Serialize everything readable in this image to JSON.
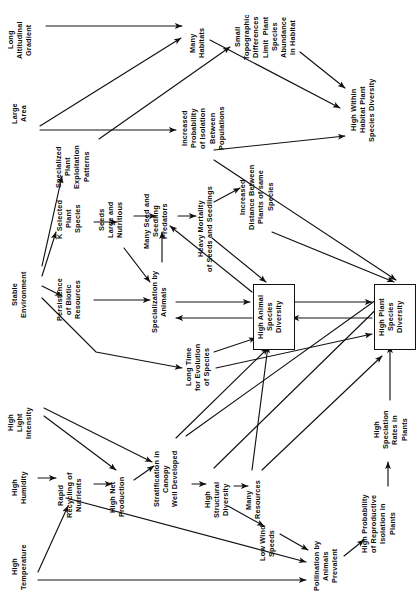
{
  "diagram": {
    "type": "flow-diagram",
    "orientation": "text-rotated-90-ccw",
    "canvas": {
      "width": 419,
      "height": 598
    },
    "colors": {
      "background": "#ffffff",
      "ink": "#0b0b0b",
      "edge": "#111111"
    },
    "nodes": [
      {
        "id": "long-altitudinal-gradient",
        "label": "Long\nAltitudinal\nGradient",
        "x": 6,
        "y": 6,
        "w": 34,
        "h": 68,
        "boxed": false
      },
      {
        "id": "large-area",
        "label": "Large\nArea",
        "x": 10,
        "y": 92,
        "w": 24,
        "h": 44,
        "boxed": false
      },
      {
        "id": "stable-environment",
        "label": "Stable\nEnvironment",
        "x": 10,
        "y": 258,
        "w": 24,
        "h": 74,
        "boxed": false
      },
      {
        "id": "high-light-intensity",
        "label": "High\nLight\nIntensity",
        "x": 6,
        "y": 398,
        "w": 34,
        "h": 50,
        "boxed": false
      },
      {
        "id": "high-humidity",
        "label": "High\nHumidity",
        "x": 10,
        "y": 462,
        "w": 24,
        "h": 52,
        "boxed": false
      },
      {
        "id": "high-temperature",
        "label": "High\nTemperature",
        "x": 10,
        "y": 536,
        "w": 24,
        "h": 62,
        "boxed": false
      },
      {
        "id": "many-habitats",
        "label": "Many\nHabitats",
        "x": 188,
        "y": 20,
        "w": 24,
        "h": 46,
        "boxed": false
      },
      {
        "id": "small-topographic-differences",
        "label": "Small\nTopographic\nDifferences\nLimit  Plant\nSpecies\nAbundance\nin Habitat",
        "x": 233,
        "y": 6,
        "w": 70,
        "h": 62,
        "boxed": false
      },
      {
        "id": "high-within-habitat-plant-species-diversity",
        "label": "High Within\nHabitat Plant\nSpecies Diversity",
        "x": 349,
        "y": 72,
        "w": 38,
        "h": 76,
        "boxed": false
      },
      {
        "id": "increased-probability-isolation",
        "label": "Increased\nProbability\nof Isolation\nBetween\nPopulations",
        "x": 180,
        "y": 100,
        "w": 50,
        "h": 56,
        "boxed": false
      },
      {
        "id": "specialized-plant-exploitation-patterns",
        "label": "Specialized\nPlant\nExploitation\nPatterns",
        "x": 54,
        "y": 138,
        "w": 42,
        "h": 58,
        "boxed": false
      },
      {
        "id": "k-selected-plant-species",
        "label": "K Selected\nPlant\nSpecies",
        "x": 55,
        "y": 192,
        "w": 34,
        "h": 54,
        "boxed": false
      },
      {
        "id": "seeds-large-and-nutritious",
        "label": "Seeds\nLarge and\nNutritious",
        "x": 97,
        "y": 194,
        "w": 34,
        "h": 52,
        "boxed": false
      },
      {
        "id": "many-seed-and-seedling-predators",
        "label": "Many Seed and\nSeedling\nPredators",
        "x": 142,
        "y": 186,
        "w": 34,
        "h": 70,
        "boxed": false
      },
      {
        "id": "heavy-mortality-seeds-seedlings",
        "label": "Heavy Mortality\nof Seeds and Seedlings",
        "x": 196,
        "y": 186,
        "w": 24,
        "h": 86,
        "boxed": false
      },
      {
        "id": "increased-distance-between-plants",
        "label": "Increased\nDistance Between\nPlants of same\nSpecies",
        "x": 238,
        "y": 162,
        "w": 46,
        "h": 70,
        "boxed": false
      },
      {
        "id": "persistence-of-biotic-resources",
        "label": "Persistence\nof Biotic\nResources",
        "x": 55,
        "y": 272,
        "w": 34,
        "h": 56,
        "boxed": false
      },
      {
        "id": "specialization-by-animals",
        "label": "Specialization by\nAnimals",
        "x": 150,
        "y": 262,
        "w": 24,
        "h": 80,
        "boxed": false
      },
      {
        "id": "long-time-for-evolution-of-species",
        "label": "Long Time\nfor Evolution\nof Species",
        "x": 184,
        "y": 340,
        "w": 36,
        "h": 54,
        "boxed": false
      },
      {
        "id": "high-animal-species-diversity",
        "label": "High Animal\nSpecies\nDiversity",
        "x": 253,
        "y": 284,
        "w": 36,
        "h": 58,
        "boxed": true
      },
      {
        "id": "high-plant-species-diversity",
        "label": "High Plant\nSpecies\nDiversity",
        "x": 374,
        "y": 284,
        "w": 36,
        "h": 58,
        "boxed": true
      },
      {
        "id": "rapid-recycling-of-nutrients",
        "label": "Rapid\nRecycling of\nNutrients",
        "x": 56,
        "y": 466,
        "w": 36,
        "h": 58,
        "boxed": false
      },
      {
        "id": "high-net-production",
        "label": "High Net\nProduction",
        "x": 108,
        "y": 470,
        "w": 26,
        "h": 54,
        "boxed": false
      },
      {
        "id": "stratification-in-canopy",
        "label": "Stratification in\nCanopy\nWell Developed",
        "x": 152,
        "y": 440,
        "w": 38,
        "h": 78,
        "boxed": false
      },
      {
        "id": "high-structural-diversity",
        "label": "High\nStructural\nDiversity",
        "x": 203,
        "y": 472,
        "w": 34,
        "h": 56,
        "boxed": false
      },
      {
        "id": "many-resources",
        "label": "Many\nResources",
        "x": 244,
        "y": 474,
        "w": 24,
        "h": 52,
        "boxed": false
      },
      {
        "id": "low-wind-speeds",
        "label": "Low Wind\nSpeeds",
        "x": 258,
        "y": 518,
        "w": 24,
        "h": 50,
        "boxed": false
      },
      {
        "id": "pollination-by-animals-prevalent",
        "label": "Pollination by\nAnimals\nPrevalent",
        "x": 312,
        "y": 534,
        "w": 36,
        "h": 64,
        "boxed": false
      },
      {
        "id": "high-probability-reproductive-isolation",
        "label": "High Probability\nof Reproductive\nIsolation in\nPlants",
        "x": 360,
        "y": 484,
        "w": 46,
        "h": 80,
        "boxed": false
      },
      {
        "id": "high-speciation-rates-in-plants",
        "label": "High\nSpeciation\nRates in\nPlants",
        "x": 372,
        "y": 402,
        "w": 42,
        "h": 56,
        "boxed": false
      }
    ],
    "edges": [
      {
        "from": "long-altitudinal-gradient",
        "to": "many-habitats",
        "d": "M 46 26 L 182 26"
      },
      {
        "from": "large-area",
        "to": "many-habitats",
        "d": "M 40 126 L 181 38"
      },
      {
        "from": "large-area",
        "to": "increased-probability-isolation",
        "d": "M 40 130 L 176 130"
      },
      {
        "from": "specialized-plant-exploitation-patterns",
        "to": "small-topographic-differences",
        "d": "M 99 139 L 230 47"
      },
      {
        "from": "many-habitats",
        "to": "high-within-habitat-plant-species-diversity",
        "d": "M 210 40 L 340 108"
      },
      {
        "from": "small-topographic-differences",
        "to": "high-within-habitat-plant-species-diversity",
        "d": "M 300 52 L 345 88"
      },
      {
        "from": "increased-probability-isolation",
        "to": "high-within-habitat-plant-species-diversity",
        "d": "M 214 150 L 345 136"
      },
      {
        "from": "stable-environment",
        "to": "specialized-plant-exploitation-patterns",
        "d": "M 42 266 L 62 176"
      },
      {
        "from": "stable-environment",
        "to": "k-selected-plant-species",
        "d": "M 42 276 L 56 232"
      },
      {
        "from": "stable-environment",
        "to": "persistence-of-biotic-resources",
        "d": "M 42 286 L 62 296"
      },
      {
        "from": "stable-environment",
        "to": "long-time-for-evolution-of-species",
        "d": "M 42 298 L 96 352 L 182 368"
      },
      {
        "from": "k-selected-plant-species",
        "to": "seeds-large-and-nutritious",
        "d": "M 94 222 L 117 222"
      },
      {
        "from": "seeds-large-and-nutritious",
        "to": "many-seed-and-seedling-predators",
        "d": "M 134 216 L 156 216"
      },
      {
        "from": "seeds-large-and-nutritious",
        "to": "specialization-by-animals",
        "d": "M 124 248 L 150 282"
      },
      {
        "from": "many-seed-and-seedling-predators",
        "to": "heavy-mortality-seeds-seedlings",
        "d": "M 178 216 L 196 216"
      },
      {
        "from": "heavy-mortality-seeds-seedlings",
        "to": "increased-distance-between-plants",
        "d": "M 214 202 L 240 188"
      },
      {
        "from": "persistence-of-biotic-resources",
        "to": "specialization-by-animals",
        "d": "M 94 300 L 150 300"
      },
      {
        "from": "specialization-by-animals",
        "to": "many-seed-and-seedling-predators",
        "d": "M 162 262 L 162 232"
      },
      {
        "from": "specialization-by-animals",
        "to": "high-animal-species-diversity",
        "d": "M 176 302 L 250 302"
      },
      {
        "from": "high-animal-species-diversity",
        "to": "specialization-by-animals",
        "d": "M 252 318 L 176 318"
      },
      {
        "from": "high-animal-species-diversity",
        "to": "many-seed-and-seedling-predators",
        "d": "M 252 292 L 170 226"
      },
      {
        "from": "heavy-mortality-seeds-seedlings",
        "to": "high-animal-species-diversity",
        "d": "M 212 238 L 266 282"
      },
      {
        "from": "increased-distance-between-plants",
        "to": "high-plant-species-diversity",
        "d": "M 272 232 L 394 282"
      },
      {
        "from": "increased-probability-isolation",
        "to": "high-plant-species-diversity",
        "d": "M 214 160 L 396 280"
      },
      {
        "from": "long-time-for-evolution-of-species",
        "to": "high-animal-species-diversity",
        "d": "M 214 352 L 256 338"
      },
      {
        "from": "long-time-for-evolution-of-species",
        "to": "high-plant-species-diversity",
        "d": "M 216 368 L 372 334"
      },
      {
        "from": "high-animal-species-diversity",
        "to": "high-plant-species-diversity",
        "d": "M 290 302 L 372 302"
      },
      {
        "from": "high-plant-species-diversity",
        "to": "high-animal-species-diversity",
        "d": "M 372 318 L 292 318"
      },
      {
        "from": "high-light-intensity",
        "to": "stratification-in-canopy",
        "d": "M 44 408 L 152 462"
      },
      {
        "from": "high-light-intensity",
        "to": "high-net-production",
        "d": "M 44 416 L 116 470"
      },
      {
        "from": "high-humidity",
        "to": "rapid-recycling-of-nutrients",
        "d": "M 38 478 L 56 478"
      },
      {
        "from": "high-temperature",
        "to": "rapid-recycling-of-nutrients",
        "d": "M 38 572 L 68 506"
      },
      {
        "from": "rapid-recycling-of-nutrients",
        "to": "high-net-production",
        "d": "M 94 484 L 112 484"
      },
      {
        "from": "high-net-production",
        "to": "stratification-in-canopy",
        "d": "M 134 480 L 154 466"
      },
      {
        "from": "stratification-in-canopy",
        "to": "high-structural-diversity",
        "d": "M 192 484 L 206 484"
      },
      {
        "from": "high-structural-diversity",
        "to": "many-resources",
        "d": "M 234 486 L 248 486"
      },
      {
        "from": "high-structural-diversity",
        "to": "low-wind-speeds",
        "d": "M 228 506 L 264 526"
      },
      {
        "from": "low-wind-speeds",
        "to": "pollination-by-animals-prevalent",
        "d": "M 280 534 L 308 550"
      },
      {
        "from": "high-humidity",
        "to": "pollination-by-animals-prevalent",
        "d": "M 66 498 L 306 562"
      },
      {
        "from": "high-temperature",
        "to": "pollination-by-animals-prevalent",
        "d": "M 38 580 L 306 580"
      },
      {
        "from": "pollination-by-animals-prevalent",
        "to": "high-probability-reproductive-isolation",
        "d": "M 344 556 L 364 540"
      },
      {
        "from": "high-probability-reproductive-isolation",
        "to": "high-speciation-rates-in-plants",
        "d": "M 388 486 L 388 462"
      },
      {
        "from": "high-speciation-rates-in-plants",
        "to": "high-plant-species-diversity",
        "d": "M 390 400 L 390 346"
      },
      {
        "from": "many-resources",
        "to": "high-animal-species-diversity",
        "d": "M 252 470 L 268 346"
      },
      {
        "from": "many-resources",
        "to": "high-plant-species-diversity",
        "d": "M 262 470 L 382 356"
      },
      {
        "from": "stratification-in-canopy",
        "to": "high-animal-species-diversity",
        "d": "M 176 438 L 268 348"
      },
      {
        "from": "stratification-in-canopy",
        "to": "high-plant-species-diversity",
        "d": "M 186 436 L 390 290"
      },
      {
        "from": "high-structural-diversity",
        "to": "high-plant-species-diversity",
        "d": "M 214 468 L 398 288"
      }
    ]
  }
}
